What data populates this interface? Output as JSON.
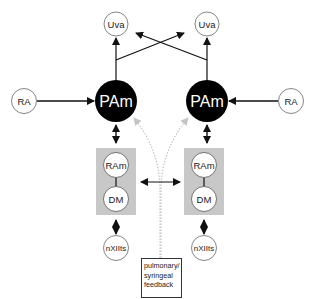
{
  "diagram": {
    "nodes": {
      "uva_left": {
        "label": "Uva"
      },
      "uva_right": {
        "label": "Uva"
      },
      "ra_left": {
        "label": "RA"
      },
      "ra_right": {
        "label": "RA"
      },
      "pam_left": {
        "label": "PAm"
      },
      "pam_right": {
        "label": "PAm"
      },
      "ram_left": {
        "label": "RAm"
      },
      "ram_right": {
        "label": "RAm"
      },
      "dm_left": {
        "label": "DM"
      },
      "dm_right": {
        "label": "DM"
      },
      "nxiits_left": {
        "label": "nXIIts"
      },
      "nxiits_right": {
        "label": "nXIIts"
      }
    },
    "feedback": {
      "lines": [
        "pulmonary/",
        "syringeal",
        "feedback"
      ]
    },
    "colors": {
      "pam_fill": "#000000",
      "box_fill": "#c8c8c8",
      "feedback_arrow": "#bdbdbd",
      "line": "#111111"
    },
    "edges": [
      {
        "from": "ra_left",
        "to": "pam_left",
        "type": "arrow"
      },
      {
        "from": "ra_right",
        "to": "pam_right",
        "type": "arrow"
      },
      {
        "from": "pam_left",
        "to": "uva_left",
        "type": "arrow"
      },
      {
        "from": "pam_left",
        "to": "uva_right",
        "type": "arrow"
      },
      {
        "from": "pam_right",
        "to": "uva_right",
        "type": "arrow"
      },
      {
        "from": "pam_right",
        "to": "uva_left",
        "type": "arrow"
      },
      {
        "from": "pam_left",
        "to": "ram_left",
        "type": "bidirectional"
      },
      {
        "from": "pam_right",
        "to": "ram_right",
        "type": "bidirectional"
      },
      {
        "from": "ram_left",
        "to": "dm_left",
        "type": "line"
      },
      {
        "from": "ram_right",
        "to": "dm_right",
        "type": "line"
      },
      {
        "from": "box_left",
        "to": "box_right",
        "type": "bidirectional"
      },
      {
        "from": "dm_left",
        "to": "nxiits_left",
        "type": "bidirectional"
      },
      {
        "from": "dm_right",
        "to": "nxiits_right",
        "type": "bidirectional"
      },
      {
        "from": "feedback",
        "to": "pam_left",
        "type": "dotted-arrow"
      },
      {
        "from": "feedback",
        "to": "pam_right",
        "type": "dotted-arrow"
      }
    ]
  }
}
